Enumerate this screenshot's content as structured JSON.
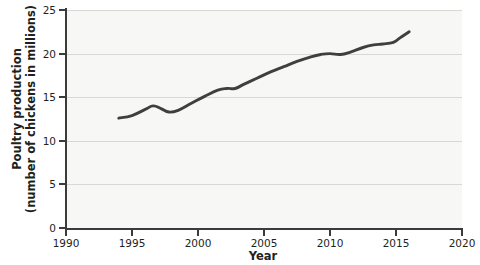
{
  "chart_data": {
    "type": "line",
    "title": "",
    "xlabel": "Year",
    "ylabel": "Poultry production\n(number of chickens in millions)",
    "xlim": [
      1990,
      2020
    ],
    "ylim": [
      0,
      25
    ],
    "xticks": [
      1990,
      1995,
      2000,
      2005,
      2010,
      2015,
      2020
    ],
    "yticks": [
      0,
      5,
      10,
      15,
      20,
      25
    ],
    "grid": "horizontal",
    "legend": "none",
    "line_color": "#3f3f3f",
    "plot_background": "#f7f7f6",
    "series": [
      {
        "name": "Poultry production",
        "x": [
          1994.0,
          1995.0,
          1996.0,
          1996.6,
          1997.2,
          1997.8,
          1998.5,
          1999.5,
          2000.5,
          2001.5,
          2002.2,
          2002.8,
          2003.5,
          2004.5,
          2005.5,
          2006.5,
          2007.5,
          2008.5,
          2009.3,
          2010.0,
          2010.8,
          2011.6,
          2012.5,
          2013.3,
          2014.0,
          2014.8,
          2015.3,
          2016.0
        ],
        "y": [
          12.6,
          12.9,
          13.6,
          14.0,
          13.7,
          13.3,
          13.5,
          14.3,
          15.1,
          15.8,
          16.0,
          16.0,
          16.5,
          17.2,
          17.9,
          18.5,
          19.1,
          19.6,
          19.9,
          20.0,
          19.9,
          20.2,
          20.7,
          21.0,
          21.1,
          21.3,
          21.8,
          22.5
        ]
      }
    ]
  },
  "axis": {
    "y_title_line1": "Poultry production",
    "y_title_line2": "(number of chickens in millions)",
    "x_title": "Year"
  },
  "ticks": {
    "y": [
      "25",
      "20",
      "15",
      "10",
      "5",
      "0"
    ],
    "x": [
      "1990",
      "1995",
      "2000",
      "2005",
      "2010",
      "2015",
      "2020"
    ]
  }
}
